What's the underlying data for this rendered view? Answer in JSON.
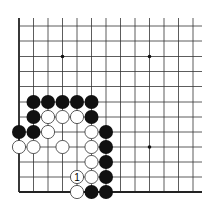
{
  "board": {
    "description": "Go problem diagram, lower-left corner of board",
    "columns": 13,
    "rows": 12,
    "col_x": [
      19,
      33.5,
      48,
      62.5,
      77,
      91.5,
      106,
      120.5,
      135,
      149.5,
      164,
      178.5,
      193
    ],
    "row_y": [
      26,
      41,
      56.5,
      71.5,
      86.5,
      102,
      117,
      132,
      147,
      162,
      177,
      192
    ],
    "top_extent": 18,
    "right_extent": 202,
    "edges": [
      "left",
      "bottom"
    ],
    "line_color": "#333333",
    "edge_color": "#222222",
    "star_points": [
      {
        "col": 3,
        "row": 2
      },
      {
        "col": 9,
        "row": 2
      },
      {
        "col": 9,
        "row": 8
      }
    ],
    "stone_radius": 7,
    "colors": {
      "black": "#111111",
      "white": "#ffffff",
      "white_stroke": "#333333"
    }
  },
  "stones": [
    {
      "color": "black",
      "col": 1,
      "row": 5
    },
    {
      "color": "black",
      "col": 2,
      "row": 5
    },
    {
      "color": "black",
      "col": 3,
      "row": 5
    },
    {
      "color": "black",
      "col": 4,
      "row": 5
    },
    {
      "color": "black",
      "col": 5,
      "row": 5
    },
    {
      "color": "black",
      "col": 1,
      "row": 6
    },
    {
      "color": "white",
      "col": 2,
      "row": 6
    },
    {
      "color": "white",
      "col": 3,
      "row": 6
    },
    {
      "color": "white",
      "col": 4,
      "row": 6
    },
    {
      "color": "black",
      "col": 5,
      "row": 6
    },
    {
      "color": "black",
      "col": 0,
      "row": 7
    },
    {
      "color": "black",
      "col": 1,
      "row": 7
    },
    {
      "color": "white",
      "col": 2,
      "row": 7
    },
    {
      "color": "white",
      "col": 5,
      "row": 7
    },
    {
      "color": "black",
      "col": 6,
      "row": 7
    },
    {
      "color": "white",
      "col": 0,
      "row": 8
    },
    {
      "color": "white",
      "col": 1,
      "row": 8
    },
    {
      "color": "white",
      "col": 3,
      "row": 8
    },
    {
      "color": "white",
      "col": 5,
      "row": 8
    },
    {
      "color": "black",
      "col": 6,
      "row": 8
    },
    {
      "color": "white",
      "col": 5,
      "row": 9
    },
    {
      "color": "black",
      "col": 6,
      "row": 9
    },
    {
      "color": "white",
      "col": 4,
      "row": 10,
      "label": "1"
    },
    {
      "color": "white",
      "col": 5,
      "row": 10
    },
    {
      "color": "black",
      "col": 6,
      "row": 10
    },
    {
      "color": "white",
      "col": 4,
      "row": 11
    },
    {
      "color": "black",
      "col": 5,
      "row": 11
    },
    {
      "color": "black",
      "col": 6,
      "row": 11
    }
  ]
}
